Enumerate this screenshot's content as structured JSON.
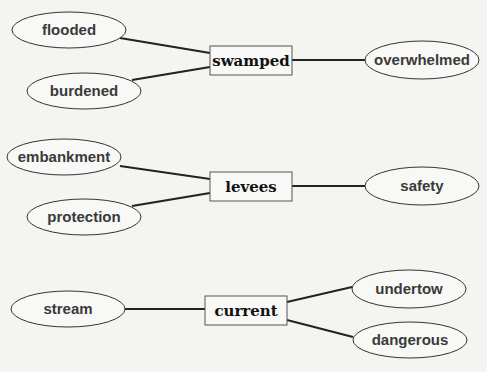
{
  "diagram": {
    "clusters": [
      {
        "center": {
          "label": "swamped",
          "x": 210,
          "y": 46,
          "w": 82,
          "h": 29
        },
        "nodes": [
          {
            "label": "flooded",
            "cx": 69,
            "cy": 30,
            "rx": 57,
            "ry": 18,
            "edge": [
              120,
              38,
              210,
              53
            ]
          },
          {
            "label": "burdened",
            "cx": 84,
            "cy": 91,
            "rx": 57,
            "ry": 18,
            "edge": [
              132,
              80,
              210,
              67
            ]
          },
          {
            "label": "overwhelmed",
            "cx": 422,
            "cy": 60,
            "rx": 57,
            "ry": 19,
            "edge": [
              292,
              60,
              365,
              60
            ]
          }
        ]
      },
      {
        "center": {
          "label": "levees",
          "x": 210,
          "y": 172,
          "w": 82,
          "h": 29
        },
        "nodes": [
          {
            "label": "embankment",
            "cx": 64,
            "cy": 157,
            "rx": 57,
            "ry": 18,
            "edge": [
              120,
              166,
              210,
              179
            ]
          },
          {
            "label": "protection",
            "cx": 84,
            "cy": 217,
            "rx": 57,
            "ry": 18,
            "edge": [
              132,
              206,
              210,
              193
            ]
          },
          {
            "label": "safety",
            "cx": 422,
            "cy": 186,
            "rx": 57,
            "ry": 19,
            "edge": [
              292,
              186,
              365,
              186
            ]
          }
        ]
      },
      {
        "center": {
          "label": "current",
          "x": 205,
          "y": 296,
          "w": 82,
          "h": 29
        },
        "nodes": [
          {
            "label": "stream",
            "cx": 68,
            "cy": 309,
            "rx": 57,
            "ry": 18,
            "edge": [
              125,
              309,
              205,
              309
            ]
          },
          {
            "label": "undertow",
            "cx": 409,
            "cy": 289,
            "rx": 57,
            "ry": 19,
            "edge": [
              287,
              302,
              352,
              287
            ]
          },
          {
            "label": "dangerous",
            "cx": 410,
            "cy": 340,
            "rx": 57,
            "ry": 18,
            "edge": [
              287,
              320,
              353,
              337
            ]
          }
        ]
      }
    ]
  }
}
